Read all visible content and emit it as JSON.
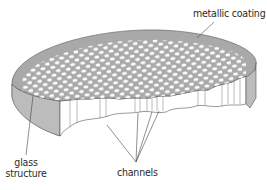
{
  "diagram": {
    "type": "cutaway-illustration",
    "labels": {
      "metallic_coating": "metallic coating",
      "glass_structure_line1": "glass",
      "glass_structure_line2": "structure",
      "channels": "channels"
    },
    "colors": {
      "top_surface": "#a9a9a9",
      "side_wall": "#bdbdbd",
      "cut_face": "#ffffff",
      "holes": "#ffffff",
      "outline": "#555555",
      "text": "#2a2a2a"
    }
  }
}
